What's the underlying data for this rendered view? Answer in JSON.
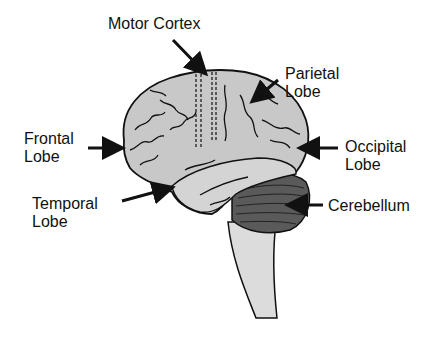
{
  "diagram": {
    "type": "brain-anatomy-lateral",
    "labels": {
      "motor_cortex": "Motor Cortex",
      "parietal_line1": "Parietal",
      "parietal_line2": "Lobe",
      "frontal_line1": "Frontal",
      "frontal_line2": "Lobe",
      "occipital_line1": "Occipital",
      "occipital_line2": "Lobe",
      "temporal_line1": "Temporal",
      "temporal_line2": "Lobe",
      "cerebellum": "Cerebellum"
    },
    "colors": {
      "brain_fill": "#c8c8c8",
      "cerebellum_fill": "#5a5a5a",
      "brainstem_fill": "#dcdcdc",
      "outline": "#111111"
    }
  }
}
